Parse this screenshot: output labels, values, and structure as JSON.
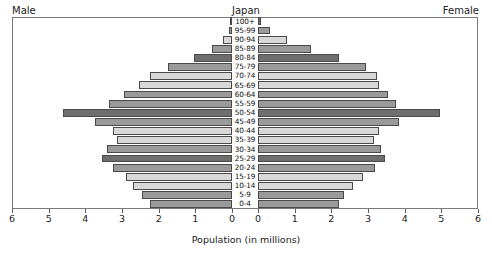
{
  "header": {
    "male_label": "Male",
    "center_title": "Japan",
    "female_label": "Female"
  },
  "axis": {
    "caption": "Population (in millions)",
    "tick_labels_male": [
      "6",
      "5",
      "4",
      "3",
      "2",
      "1",
      "0"
    ],
    "tick_labels_female": [
      "0",
      "1",
      "2",
      "3",
      "4",
      "5",
      "6"
    ]
  },
  "colors": {
    "bar_dark": "#6e6e6e",
    "bar_mid": "#9a9a9a",
    "bar_light": "#d8d8d8",
    "bar_outline": "#4a4a4a",
    "frame": "#7a7a7a",
    "text": "#1a1a1a",
    "background": "#ffffff"
  },
  "chart_data": {
    "type": "bar",
    "subtype": "population-pyramid",
    "title": "Japan",
    "xlabel": "Population (in millions)",
    "ylabel": "",
    "xlim": [
      0,
      6
    ],
    "xticks": [
      0,
      1,
      2,
      3,
      4,
      5,
      6
    ],
    "grid": false,
    "legend": "none",
    "orientation": "horizontal",
    "left_panel": "Male",
    "right_panel": "Female",
    "categories": [
      "100+",
      "95-99",
      "90-94",
      "85-89",
      "80-84",
      "75-79",
      "70-74",
      "65-69",
      "60-64",
      "55-59",
      "50-54",
      "45-49",
      "40-44",
      "35-39",
      "30-34",
      "25-29",
      "20-24",
      "15-19",
      "10-14",
      "5-9",
      "0-4"
    ],
    "series": [
      {
        "name": "Male",
        "side": "left",
        "values": [
          0.01,
          0.08,
          0.25,
          0.55,
          1.05,
          1.75,
          2.25,
          2.55,
          2.95,
          3.35,
          4.6,
          3.75,
          3.25,
          3.15,
          3.4,
          3.55,
          3.25,
          2.9,
          2.7,
          2.45,
          2.25
        ],
        "shades": [
          "dark",
          "mid",
          "light",
          "mid",
          "dark",
          "mid",
          "light",
          "light",
          "mid",
          "mid",
          "dark",
          "mid",
          "light",
          "light",
          "mid",
          "dark",
          "mid",
          "light",
          "light",
          "mid",
          "mid"
        ]
      },
      {
        "name": "Female",
        "side": "right",
        "values": [
          0.07,
          0.32,
          0.8,
          1.45,
          2.2,
          2.95,
          3.25,
          3.3,
          3.55,
          3.75,
          4.95,
          3.85,
          3.3,
          3.15,
          3.35,
          3.45,
          3.2,
          2.85,
          2.6,
          2.35,
          2.2
        ],
        "shades": [
          "dark",
          "mid",
          "light",
          "mid",
          "dark",
          "mid",
          "light",
          "light",
          "mid",
          "mid",
          "dark",
          "mid",
          "light",
          "light",
          "mid",
          "dark",
          "mid",
          "light",
          "light",
          "mid",
          "mid"
        ]
      }
    ]
  }
}
